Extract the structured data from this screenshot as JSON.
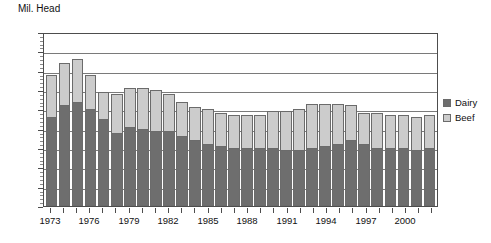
{
  "chart_data": {
    "type": "bar",
    "subtype": "stacked-column",
    "title": "",
    "ylabel": "Mil. Head",
    "xlabel": "",
    "ylim": [
      20,
      65
    ],
    "ytick_step": 5,
    "yticks": [
      20,
      25,
      30,
      35,
      40,
      45,
      50,
      55,
      60,
      65
    ],
    "grid": true,
    "grid_axis": "y",
    "legend_position": "right",
    "categories": [
      "1973",
      "1974",
      "1975",
      "1976",
      "1977",
      "1978",
      "1979",
      "1980",
      "1981",
      "1982",
      "1983",
      "1984",
      "1985",
      "1986",
      "1987",
      "1988",
      "1989",
      "1990",
      "1991",
      "1992",
      "1993",
      "1994",
      "1995",
      "1996",
      "1997",
      "1998",
      "1999",
      "2000",
      "2001",
      "2002"
    ],
    "xtick_labels": [
      "1973",
      "1976",
      "1979",
      "1982",
      "1985",
      "1988",
      "1991",
      "1994",
      "1997",
      "2000"
    ],
    "series": [
      {
        "name": "Dairy",
        "color": "#6e6e6e",
        "values": [
          43.0,
          46.0,
          47.0,
          45.0,
          42.5,
          39.0,
          40.5,
          40.0,
          39.5,
          39.5,
          38.0,
          37.0,
          36.0,
          35.5,
          35.0,
          35.0,
          35.0,
          35.0,
          34.5,
          34.5,
          35.0,
          35.5,
          36.0,
          37.0,
          36.0,
          35.0,
          35.0,
          35.0,
          34.5,
          35.0
        ],
        "unit": "Mil. Head"
      },
      {
        "name": "Beef",
        "color": "#cccccc",
        "values": [
          11.0,
          11.0,
          11.0,
          9.0,
          7.0,
          10.0,
          10.0,
          10.5,
          10.5,
          9.5,
          9.0,
          8.5,
          9.0,
          8.5,
          8.5,
          8.5,
          8.5,
          9.5,
          10.0,
          10.5,
          11.5,
          11.0,
          10.5,
          9.0,
          8.0,
          9.0,
          8.5,
          8.5,
          8.5,
          8.5
        ],
        "unit": "Mil. Head"
      }
    ],
    "totals": [
      54.0,
      57.0,
      58.0,
      54.0,
      49.5,
      49.0,
      50.5,
      50.5,
      50.0,
      49.0,
      47.0,
      45.5,
      45.0,
      44.0,
      43.5,
      43.5,
      43.5,
      44.5,
      44.5,
      45.0,
      46.5,
      46.5,
      46.5,
      46.0,
      44.0,
      44.0,
      43.5,
      43.5,
      43.0,
      43.5
    ]
  },
  "legend": {
    "items": [
      {
        "label": "Dairy"
      },
      {
        "label": "Beef"
      }
    ]
  }
}
